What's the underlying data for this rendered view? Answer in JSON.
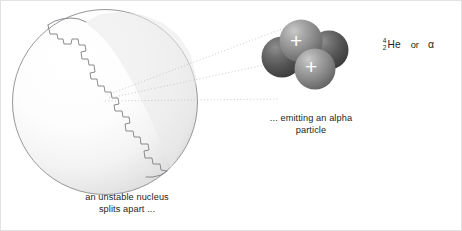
{
  "figure": {
    "background_color": "#ffffff",
    "text_color": "#231f20",
    "width": 462,
    "height": 231
  },
  "nucleus": {
    "label": "an unstable nucleus\nsplits apart ...",
    "fill_light": "#ffffff",
    "fill_shadow": "#d8d8d8",
    "outline_color": "#808285",
    "center_x": 104,
    "center_y": 101,
    "radius": 93,
    "crack_description": "jagged staircase fissure running from upper-left rim diagonally to lower-right rim"
  },
  "alpha_particle": {
    "label": "... emitting an alpha\nparticle",
    "nucleon_count": 4,
    "proton_count": 2,
    "neutron_count": 2,
    "proton_symbol": "+",
    "proton_color": "#8c8c8c",
    "neutron_color": "#555555",
    "proton_symbol_color": "#ffffff",
    "nucleons": [
      {
        "name": "neutron-back-right",
        "cx": 328,
        "cy": 49,
        "r": 19,
        "type": "neutron"
      },
      {
        "name": "neutron-back-left",
        "cx": 282,
        "cy": 55,
        "r": 20,
        "type": "neutron"
      },
      {
        "name": "proton-top",
        "cx": 301,
        "cy": 40,
        "r": 21,
        "type": "proton"
      },
      {
        "name": "proton-bottom",
        "cx": 314,
        "cy": 67,
        "r": 20,
        "type": "proton"
      }
    ]
  },
  "connectors": {
    "name": "dotted-emission-lines",
    "count": 3,
    "color": "#b9b9b9",
    "style": "dotted",
    "lines": [
      {
        "x1": 106,
        "y1": 94,
        "x2": 284,
        "y2": 28
      },
      {
        "x1": 108,
        "y1": 97,
        "x2": 281,
        "y2": 62
      },
      {
        "x1": 104,
        "y1": 100,
        "x2": 276,
        "y2": 97
      }
    ]
  },
  "nuclide": {
    "mass_number": "4",
    "atomic_number": "2",
    "symbol": "He",
    "conjunction": "or",
    "alternate_symbol": "α"
  }
}
